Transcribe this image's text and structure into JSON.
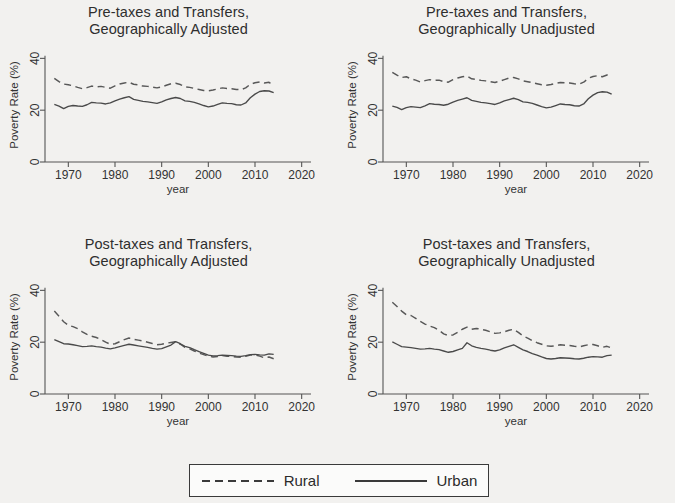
{
  "figure": {
    "background_color": "#f2f1ef",
    "line_color": "#555555"
  },
  "legend": {
    "position": "bottom-center",
    "entries": [
      {
        "label": "Rural",
        "style": "dashed",
        "swatch_name": "rural-dashed-swatch"
      },
      {
        "label": "Urban",
        "style": "solid",
        "swatch_name": "urban-solid-swatch"
      }
    ]
  },
  "axes": {
    "xlabel": "year",
    "ylabel": "Poverty Rate (%)",
    "xticks": [
      "1970",
      "1980",
      "1990",
      "2000",
      "2010",
      "2020"
    ],
    "yticks": [
      "0",
      "20",
      "40"
    ],
    "xlim": [
      1965,
      2022
    ],
    "ylim": [
      0,
      44
    ],
    "grid": false
  },
  "panels": [
    {
      "title_line1": "Pre-taxes and Transfers,",
      "title_line2": "Geographically Adjusted"
    },
    {
      "title_line1": "Pre-taxes and Transfers,",
      "title_line2": "Geographically Unadjusted"
    },
    {
      "title_line1": "Post-taxes and Transfers,",
      "title_line2": "Geographically Adjusted"
    },
    {
      "title_line1": "Post-taxes and Transfers,",
      "title_line2": "Geographically Unadjusted"
    }
  ],
  "chart_data": [
    {
      "type": "line",
      "title": "Pre-taxes and Transfers, Geographically Adjusted",
      "xlabel": "year",
      "ylabel": "Poverty Rate (%)",
      "xlim": [
        1965,
        2022
      ],
      "ylim": [
        0,
        44
      ],
      "xticks": [
        1970,
        1980,
        1990,
        2000,
        2010,
        2020
      ],
      "yticks": [
        0,
        20,
        40
      ],
      "grid": false,
      "x": [
        1967,
        1968,
        1969,
        1970,
        1971,
        1972,
        1973,
        1974,
        1975,
        1976,
        1977,
        1978,
        1979,
        1980,
        1981,
        1982,
        1983,
        1984,
        1985,
        1986,
        1987,
        1988,
        1989,
        1990,
        1991,
        1992,
        1993,
        1994,
        1995,
        1996,
        1997,
        1998,
        1999,
        2000,
        2001,
        2002,
        2003,
        2004,
        2005,
        2006,
        2007,
        2008,
        2009,
        2010,
        2011,
        2012,
        2013,
        2014
      ],
      "series": [
        {
          "name": "Rural",
          "style": "dashed",
          "values": [
            32.3,
            31.0,
            30.1,
            29.8,
            29.4,
            28.8,
            28.3,
            28.7,
            29.3,
            29.0,
            29.2,
            28.8,
            28.5,
            29.4,
            30.1,
            30.5,
            30.8,
            30.0,
            29.8,
            29.3,
            29.2,
            28.9,
            28.6,
            29.0,
            29.6,
            30.2,
            30.4,
            29.9,
            29.0,
            28.8,
            28.4,
            28.0,
            27.6,
            27.5,
            27.8,
            28.2,
            28.6,
            28.4,
            28.3,
            28.0,
            27.9,
            28.6,
            30.0,
            30.6,
            30.9,
            30.5,
            30.8,
            29.3
          ]
        },
        {
          "name": "Urban",
          "style": "solid",
          "values": [
            22.2,
            21.6,
            20.6,
            21.5,
            21.8,
            21.6,
            21.5,
            22.1,
            23.0,
            22.8,
            22.7,
            22.4,
            22.8,
            23.6,
            24.3,
            24.8,
            25.2,
            24.2,
            23.8,
            23.4,
            23.2,
            22.9,
            22.6,
            23.2,
            24.0,
            24.5,
            24.9,
            24.5,
            23.6,
            23.4,
            23.0,
            22.4,
            21.8,
            21.3,
            21.6,
            22.2,
            22.8,
            22.6,
            22.5,
            22.1,
            22.0,
            22.8,
            24.8,
            26.2,
            27.2,
            27.5,
            27.4,
            26.8
          ]
        }
      ]
    },
    {
      "type": "line",
      "title": "Pre-taxes and Transfers, Geographically Unadjusted",
      "xlabel": "year",
      "ylabel": "Poverty Rate (%)",
      "xlim": [
        1965,
        2022
      ],
      "ylim": [
        0,
        44
      ],
      "xticks": [
        1970,
        1980,
        1990,
        2000,
        2010,
        2020
      ],
      "yticks": [
        0,
        20,
        40
      ],
      "grid": false,
      "x": [
        1967,
        1968,
        1969,
        1970,
        1971,
        1972,
        1973,
        1974,
        1975,
        1976,
        1977,
        1978,
        1979,
        1980,
        1981,
        1982,
        1983,
        1984,
        1985,
        1986,
        1987,
        1988,
        1989,
        1990,
        1991,
        1992,
        1993,
        1994,
        1995,
        1996,
        1997,
        1998,
        1999,
        2000,
        2001,
        2002,
        2003,
        2004,
        2005,
        2006,
        2007,
        2008,
        2009,
        2010,
        2011,
        2012,
        2013,
        2014
      ],
      "series": [
        {
          "name": "Rural",
          "style": "dashed",
          "values": [
            34.6,
            33.5,
            32.6,
            32.9,
            32.1,
            31.6,
            30.9,
            31.4,
            31.8,
            31.5,
            31.6,
            31.0,
            30.8,
            31.8,
            32.4,
            32.9,
            33.2,
            32.1,
            31.9,
            31.5,
            31.3,
            31.0,
            30.7,
            31.2,
            31.8,
            32.4,
            32.6,
            32.1,
            31.3,
            31.0,
            30.6,
            30.2,
            29.8,
            29.6,
            29.9,
            30.3,
            30.7,
            30.6,
            30.5,
            30.2,
            30.0,
            30.8,
            32.3,
            33.0,
            33.3,
            32.9,
            33.6,
            32.8
          ]
        },
        {
          "name": "Urban",
          "style": "solid",
          "values": [
            21.6,
            21.1,
            20.2,
            21.0,
            21.4,
            21.2,
            21.0,
            21.7,
            22.5,
            22.3,
            22.2,
            21.9,
            22.3,
            23.1,
            23.8,
            24.3,
            24.8,
            23.8,
            23.4,
            23.0,
            22.8,
            22.5,
            22.2,
            22.8,
            23.6,
            24.1,
            24.6,
            24.1,
            23.2,
            23.0,
            22.6,
            22.0,
            21.4,
            20.9,
            21.2,
            21.8,
            22.4,
            22.2,
            22.1,
            21.7,
            21.6,
            22.4,
            24.4,
            25.8,
            26.8,
            27.1,
            27.0,
            26.2
          ]
        }
      ]
    },
    {
      "type": "line",
      "title": "Post-taxes and Transfers, Geographically Adjusted",
      "xlabel": "year",
      "ylabel": "Poverty Rate (%)",
      "xlim": [
        1965,
        2022
      ],
      "ylim": [
        0,
        44
      ],
      "xticks": [
        1970,
        1980,
        1990,
        2000,
        2010,
        2020
      ],
      "yticks": [
        0,
        20,
        40
      ],
      "grid": false,
      "x": [
        1967,
        1968,
        1969,
        1970,
        1971,
        1972,
        1973,
        1974,
        1975,
        1976,
        1977,
        1978,
        1979,
        1980,
        1981,
        1982,
        1983,
        1984,
        1985,
        1986,
        1987,
        1988,
        1989,
        1990,
        1991,
        1992,
        1993,
        1994,
        1995,
        1996,
        1997,
        1998,
        1999,
        2000,
        2001,
        2002,
        2003,
        2004,
        2005,
        2006,
        2007,
        2008,
        2009,
        2010,
        2011,
        2012,
        2013,
        2014
      ],
      "series": [
        {
          "name": "Rural",
          "style": "dashed",
          "values": [
            32.0,
            30.0,
            27.9,
            26.5,
            26.0,
            25.2,
            24.0,
            23.0,
            22.3,
            21.8,
            21.0,
            20.0,
            19.2,
            19.4,
            20.2,
            21.0,
            21.6,
            21.1,
            20.8,
            20.4,
            20.0,
            19.5,
            19.0,
            19.2,
            19.6,
            19.9,
            20.2,
            19.2,
            18.0,
            17.4,
            16.6,
            15.8,
            15.2,
            14.6,
            14.3,
            14.5,
            14.8,
            14.6,
            14.5,
            14.3,
            14.2,
            14.6,
            15.0,
            15.1,
            14.6,
            14.0,
            14.3,
            13.6
          ]
        },
        {
          "name": "Urban",
          "style": "solid",
          "values": [
            21.0,
            20.2,
            19.4,
            19.3,
            19.0,
            18.7,
            18.3,
            18.4,
            18.6,
            18.3,
            18.1,
            17.7,
            17.4,
            17.8,
            18.3,
            18.8,
            19.2,
            18.9,
            18.6,
            18.3,
            18.0,
            17.6,
            17.3,
            17.5,
            18.2,
            18.9,
            20.2,
            19.4,
            18.4,
            17.9,
            17.1,
            16.4,
            15.7,
            15.0,
            14.7,
            14.8,
            15.0,
            14.9,
            14.8,
            14.6,
            14.5,
            14.8,
            15.2,
            15.3,
            15.1,
            15.0,
            15.5,
            15.3
          ]
        }
      ]
    },
    {
      "type": "line",
      "title": "Post-taxes and Transfers, Geographically Unadjusted",
      "xlabel": "year",
      "ylabel": "Poverty Rate (%)",
      "xlim": [
        1965,
        2022
      ],
      "ylim": [
        0,
        44
      ],
      "xticks": [
        1970,
        1980,
        1990,
        2000,
        2010,
        2020
      ],
      "yticks": [
        0,
        20,
        40
      ],
      "grid": false,
      "x": [
        1967,
        1968,
        1969,
        1970,
        1971,
        1972,
        1973,
        1974,
        1975,
        1976,
        1977,
        1978,
        1979,
        1980,
        1981,
        1982,
        1983,
        1984,
        1985,
        1986,
        1987,
        1988,
        1989,
        1990,
        1991,
        1992,
        1993,
        1994,
        1995,
        1996,
        1997,
        1998,
        1999,
        2000,
        2001,
        2002,
        2003,
        2004,
        2005,
        2006,
        2007,
        2008,
        2009,
        2010,
        2011,
        2012,
        2013,
        2014
      ],
      "series": [
        {
          "name": "Rural",
          "style": "dashed",
          "values": [
            35.4,
            33.8,
            32.0,
            30.6,
            30.3,
            29.2,
            28.0,
            27.0,
            26.2,
            25.6,
            24.6,
            23.2,
            22.6,
            22.8,
            23.8,
            25.0,
            25.8,
            25.0,
            25.3,
            25.0,
            24.6,
            24.0,
            23.4,
            23.6,
            24.0,
            24.6,
            25.0,
            23.8,
            22.4,
            21.6,
            20.6,
            19.8,
            19.2,
            18.6,
            18.4,
            18.6,
            19.0,
            18.8,
            18.7,
            18.4,
            18.2,
            18.6,
            19.0,
            19.1,
            18.6,
            18.0,
            18.4,
            17.8
          ]
        },
        {
          "name": "Urban",
          "style": "solid",
          "values": [
            20.1,
            19.2,
            18.3,
            18.1,
            17.9,
            17.6,
            17.3,
            17.4,
            17.6,
            17.3,
            17.1,
            16.6,
            16.1,
            16.4,
            17.0,
            17.6,
            19.8,
            18.6,
            18.0,
            17.6,
            17.3,
            16.9,
            16.6,
            17.0,
            17.8,
            18.4,
            19.0,
            18.0,
            17.0,
            16.4,
            15.6,
            15.0,
            14.3,
            13.7,
            13.5,
            13.7,
            14.0,
            13.9,
            13.8,
            13.6,
            13.5,
            13.8,
            14.2,
            14.4,
            14.3,
            14.2,
            14.8,
            15.0
          ]
        }
      ]
    }
  ]
}
